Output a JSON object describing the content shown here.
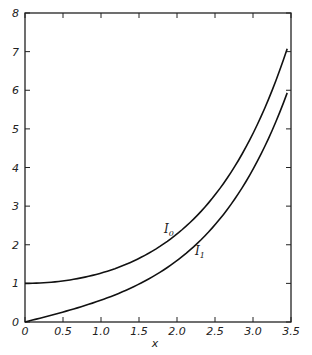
{
  "chart_data": {
    "type": "line",
    "title": "",
    "xlabel": "x",
    "ylabel": "",
    "xlim": [
      0,
      3.5
    ],
    "ylim": [
      0,
      8
    ],
    "grid": false,
    "x_ticks": [
      "0",
      "0.5",
      "1.0",
      "1.5",
      "2.0",
      "2.5",
      "3.0",
      "3.5"
    ],
    "y_ticks": [
      "0",
      "1",
      "2",
      "3",
      "4",
      "5",
      "6",
      "7",
      "8"
    ],
    "x": [
      0,
      0.25,
      0.5,
      0.75,
      1.0,
      1.25,
      1.5,
      1.75,
      2.0,
      2.25,
      2.5,
      2.75,
      3.0,
      3.25,
      3.45
    ],
    "series": [
      {
        "name": "I0",
        "label_main": "I",
        "label_sub": "0",
        "values": [
          1.0,
          1.016,
          1.063,
          1.146,
          1.266,
          1.43,
          1.647,
          1.928,
          2.28,
          2.72,
          3.29,
          3.99,
          4.88,
          5.98,
          7.07
        ]
      },
      {
        "name": "I1",
        "label_main": "I",
        "label_sub": "1",
        "values": [
          0.0,
          0.126,
          0.258,
          0.401,
          0.565,
          0.755,
          0.982,
          1.255,
          1.59,
          2.0,
          2.52,
          3.15,
          3.95,
          4.95,
          5.93
        ]
      }
    ]
  }
}
